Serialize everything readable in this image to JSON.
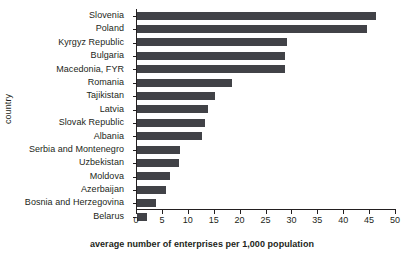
{
  "chart_data": {
    "type": "bar",
    "orientation": "horizontal",
    "title": "",
    "xlabel": "average number of enterprises per 1,000 population",
    "ylabel": "country",
    "xlim": [
      0,
      50
    ],
    "xticks": [
      0,
      5,
      10,
      15,
      20,
      25,
      30,
      35,
      40,
      45,
      50
    ],
    "grid": false,
    "legend": null,
    "bar_color": "#414247",
    "axis_color": "#231f20",
    "categories": [
      "Slovenia",
      "Poland",
      "Kyrgyz Republic",
      "Bulgaria",
      "Macedonia, FYR",
      "Romania",
      "Tajikistan",
      "Latvia",
      "Slovak Republic",
      "Albania",
      "Serbia and Montenegro",
      "Uzbekistan",
      "Moldova",
      "Azerbaijan",
      "Bosnia and Herzegovina",
      "Belarus"
    ],
    "values": [
      46.1,
      44.4,
      29.0,
      28.6,
      28.6,
      18.3,
      15.0,
      13.7,
      13.1,
      12.5,
      8.3,
      8.1,
      6.4,
      5.6,
      3.7,
      2.0
    ]
  }
}
